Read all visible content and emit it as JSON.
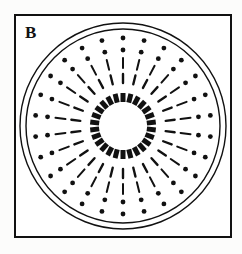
{
  "figure": {
    "panel_label": "B",
    "caption": "",
    "background_color": "#fcfcfb",
    "ink_color": "#111111"
  },
  "frame": {
    "name": "panel-border",
    "x": 14,
    "y": 14,
    "width": 218,
    "height": 224,
    "stroke_width": 2,
    "stroke_color": "#111111",
    "fill": "#ffffff"
  },
  "chart_data": {
    "type": "scatter",
    "title": "B",
    "subtitle": "",
    "xlabel": "",
    "ylabel": "",
    "grid": false,
    "legend_position": "none",
    "coordinate_system": "polar",
    "center": {
      "x": 123,
      "y": 126
    },
    "spoke_count": 26,
    "angle_offset_deg": -90,
    "annotations": [],
    "series": [
      {
        "name": "outer-boundary-circle",
        "element": "circle",
        "radius": 103,
        "stroke_width": 1.4,
        "stroke_color": "#111111",
        "fill": "none"
      },
      {
        "name": "inner-boundary-circle",
        "element": "circle",
        "radius": 97,
        "stroke_width": 1.4,
        "stroke_color": "#111111",
        "fill": "none"
      },
      {
        "name": "outer-dot-ring",
        "element": "dots",
        "radius": 88,
        "count": 26,
        "dot_radius": 2.4,
        "fill": "#111111"
      },
      {
        "name": "inner-dot-ring",
        "element": "dots",
        "radius": 76,
        "count": 26,
        "dot_radius": 2.4,
        "fill": "#111111"
      },
      {
        "name": "outer-dash-ring",
        "element": "radial-ticks",
        "radius_outer": 68,
        "radius_inner": 58,
        "count": 26,
        "stroke_width": 2.0,
        "stroke_color": "#111111"
      },
      {
        "name": "inner-dash-ring",
        "element": "radial-ticks",
        "radius_outer": 52,
        "radius_inner": 43,
        "count": 26,
        "stroke_width": 2.4,
        "stroke_color": "#111111"
      },
      {
        "name": "central-tooth-ring",
        "element": "radial-teeth",
        "radius_outer": 33,
        "radius_inner": 24,
        "count": 26,
        "stroke_width": 5.0,
        "stroke_color": "#111111"
      }
    ]
  }
}
